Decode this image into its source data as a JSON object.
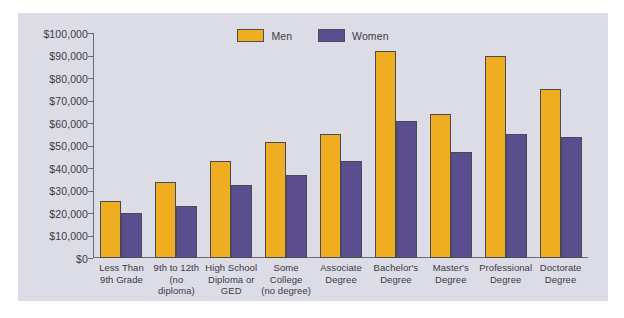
{
  "legend": {
    "entries": [
      {
        "label": "Men",
        "color": "#efae21",
        "swatch_name": "legend-swatch-men"
      },
      {
        "label": "Women",
        "color": "#5b4e8e",
        "swatch_name": "legend-swatch-women"
      }
    ]
  },
  "axis": {
    "tick_labels": [
      "$100,000",
      "$90,000",
      "$80,000",
      "$70,000",
      "$60,000",
      "$50,000",
      "$40,000",
      "$30,000",
      "$20,000",
      "$10,000",
      "$0"
    ]
  },
  "chart_data": {
    "type": "bar",
    "title": "",
    "xlabel": "",
    "ylabel": "",
    "ylim": [
      0,
      100000
    ],
    "ytick_step": 10000,
    "grid": false,
    "legend_position": "top-center",
    "categories": [
      "Less Than 9th Grade",
      "9th to 12th (no diploma)",
      "High School Diploma or GED",
      "Some College (no degree)",
      "Associate Degree",
      "Bachelor's Degree",
      "Master's Degree",
      "Professional Degree",
      "Doctorate Degree"
    ],
    "category_lines": [
      [
        "Less Than",
        "9th Grade"
      ],
      [
        "9th to 12th",
        "(no diploma)"
      ],
      [
        "High School",
        "Diploma or",
        "GED"
      ],
      [
        "Some",
        "College",
        "(no degree)"
      ],
      [
        "Associate",
        "Degree"
      ],
      [
        "Bachelor's",
        "Degree"
      ],
      [
        "Master's",
        "Degree"
      ],
      [
        "Professional",
        "Degree"
      ],
      [
        "Doctorate",
        "Degree"
      ]
    ],
    "series": [
      {
        "name": "Men",
        "color": "#efae21",
        "values": [
          25500,
          34000,
          43000,
          51500,
          55000,
          92000,
          64000,
          90000,
          75000
        ]
      },
      {
        "name": "Women",
        "color": "#5b4e8e",
        "values": [
          20000,
          23000,
          32500,
          37000,
          43000,
          61000,
          47000,
          55000,
          54000
        ]
      }
    ]
  }
}
